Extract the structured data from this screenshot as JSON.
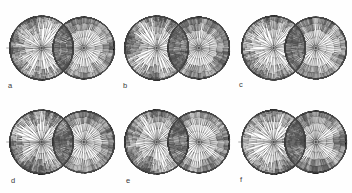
{
  "figure": {
    "background_color": "#fefefe",
    "stroke_color": "#4a4a4a",
    "width": 352,
    "height": 193,
    "rows": 2,
    "columns": 3
  },
  "panels": [
    {
      "id": "panel-a",
      "label": "a",
      "row": 0,
      "column": 0,
      "x": 4,
      "y": 3,
      "width": 114,
      "height": 90,
      "label_x": 8,
      "label_y": 82,
      "left_lobe": {
        "center_x": 0.33,
        "center_y": 0.5,
        "radius": 0.3,
        "depth": 7,
        "branch_count": 14,
        "style": "dense-irregular",
        "seed": 11
      },
      "right_lobe": {
        "center_x": 0.7,
        "center_y": 0.5,
        "radius": 0.29,
        "depth": 7,
        "branch_count": 16,
        "style": "regular-symmetric",
        "seed": 23
      },
      "has_axis_line": true
    },
    {
      "id": "panel-b",
      "label": "b",
      "row": 0,
      "column": 1,
      "x": 119,
      "y": 3,
      "width": 114,
      "height": 90,
      "label_x": 123,
      "label_y": 82,
      "left_lobe": {
        "center_x": 0.33,
        "center_y": 0.5,
        "radius": 0.3,
        "depth": 7,
        "branch_count": 14,
        "style": "dense-irregular",
        "seed": 37
      },
      "right_lobe": {
        "center_x": 0.7,
        "center_y": 0.5,
        "radius": 0.29,
        "depth": 7,
        "branch_count": 16,
        "style": "regular-symmetric",
        "seed": 41
      },
      "has_axis_line": false
    },
    {
      "id": "panel-c",
      "label": "c",
      "row": 0,
      "column": 2,
      "x": 236,
      "y": 3,
      "width": 114,
      "height": 90,
      "label_x": 239,
      "label_y": 81,
      "left_lobe": {
        "center_x": 0.33,
        "center_y": 0.5,
        "radius": 0.3,
        "depth": 7,
        "branch_count": 13,
        "style": "dense-irregular",
        "seed": 59
      },
      "right_lobe": {
        "center_x": 0.7,
        "center_y": 0.5,
        "radius": 0.29,
        "depth": 7,
        "branch_count": 16,
        "style": "regular-symmetric",
        "seed": 67
      },
      "has_axis_line": false
    },
    {
      "id": "panel-d",
      "label": "d",
      "row": 1,
      "column": 0,
      "x": 4,
      "y": 97,
      "width": 114,
      "height": 90,
      "label_x": 11,
      "label_y": 177,
      "left_lobe": {
        "center_x": 0.33,
        "center_y": 0.5,
        "radius": 0.3,
        "depth": 7,
        "branch_count": 15,
        "style": "dense-irregular",
        "seed": 83
      },
      "right_lobe": {
        "center_x": 0.7,
        "center_y": 0.5,
        "radius": 0.29,
        "depth": 7,
        "branch_count": 16,
        "style": "regular-symmetric",
        "seed": 97
      },
      "has_axis_line": true
    },
    {
      "id": "panel-e",
      "label": "e",
      "row": 1,
      "column": 1,
      "x": 119,
      "y": 97,
      "width": 114,
      "height": 90,
      "label_x": 126,
      "label_y": 177,
      "left_lobe": {
        "center_x": 0.33,
        "center_y": 0.5,
        "radius": 0.3,
        "depth": 7,
        "branch_count": 15,
        "style": "dense-irregular",
        "seed": 103
      },
      "right_lobe": {
        "center_x": 0.7,
        "center_y": 0.5,
        "radius": 0.29,
        "depth": 7,
        "branch_count": 16,
        "style": "regular-symmetric",
        "seed": 109
      },
      "has_axis_line": false
    },
    {
      "id": "panel-f",
      "label": "f",
      "row": 1,
      "column": 2,
      "x": 236,
      "y": 97,
      "width": 114,
      "height": 90,
      "label_x": 240,
      "label_y": 176,
      "left_lobe": {
        "center_x": 0.33,
        "center_y": 0.5,
        "radius": 0.3,
        "depth": 7,
        "branch_count": 14,
        "style": "dense-irregular",
        "seed": 127
      },
      "right_lobe": {
        "center_x": 0.7,
        "center_y": 0.5,
        "radius": 0.29,
        "depth": 7,
        "branch_count": 16,
        "style": "regular-symmetric",
        "seed": 131
      },
      "has_axis_line": true
    }
  ]
}
